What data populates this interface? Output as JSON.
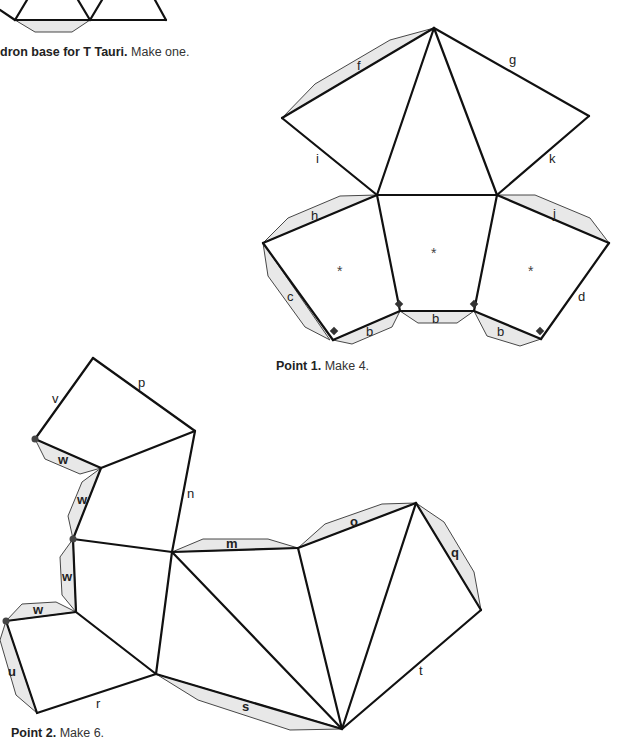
{
  "captions": {
    "top": {
      "bold": "dron base for T Tauri.",
      "text": " Make one."
    },
    "point1": {
      "bold": "Point 1.",
      "text": " Make 4."
    },
    "point2": {
      "bold": "Point 2.",
      "text": " Make 6."
    }
  },
  "edge_labels": {
    "f": "f",
    "g": "g",
    "i": "i",
    "k": "k",
    "h": "h",
    "j": "j",
    "c": "c",
    "d": "d",
    "b1": "b",
    "b2": "b",
    "b3": "b",
    "v": "v",
    "p": "p",
    "n": "n",
    "w1": "w",
    "w2": "w",
    "w3": "w",
    "w4": "w",
    "m": "m",
    "o": "o",
    "q": "q",
    "u": "u",
    "r": "r",
    "s": "s",
    "t": "t"
  },
  "face_marks": {
    "star": "*"
  },
  "colors": {
    "line": "#111111",
    "tab_fill": "#e8e8e8",
    "marker": "#444444"
  }
}
